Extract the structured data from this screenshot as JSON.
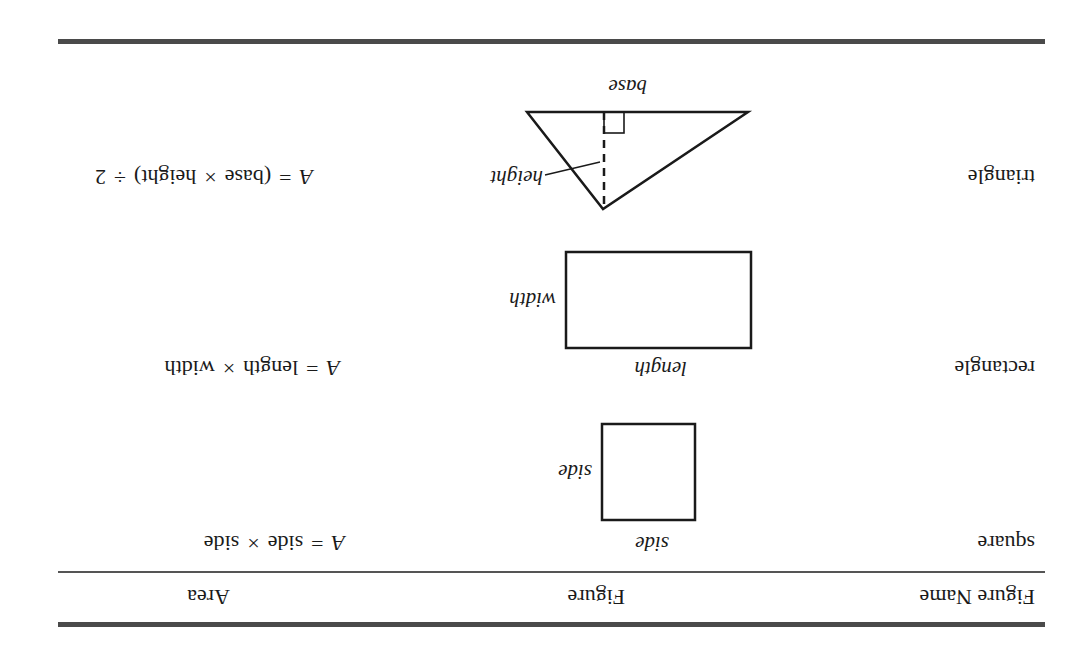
{
  "table": {
    "headers": {
      "figure_name": "Figure Name",
      "figure": "Figure",
      "area": "Area"
    },
    "rows": [
      {
        "name": "square",
        "figure_labels": {
          "bottom": "side",
          "side": "side"
        },
        "formula": {
          "lhs": "A",
          "eq": "=",
          "a": "side",
          "op": "×",
          "b": "side"
        }
      },
      {
        "name": "rectangle",
        "figure_labels": {
          "bottom": "length",
          "side": "width"
        },
        "formula": {
          "lhs": "A",
          "eq": "=",
          "a": "length",
          "op": "×",
          "b": "width"
        }
      },
      {
        "name": "triangle",
        "figure_labels": {
          "base": "base",
          "height": "height"
        },
        "formula": {
          "lhs": "A",
          "eq": "=",
          "a": "(base",
          "op": "×",
          "b": "height)",
          "op2": "÷",
          "c": "2"
        }
      }
    ]
  },
  "orientation": "rotated 180 degrees",
  "colors": {
    "rule": "#4a4a4a",
    "ink": "#1a1a1a",
    "background": "#ffffff"
  }
}
